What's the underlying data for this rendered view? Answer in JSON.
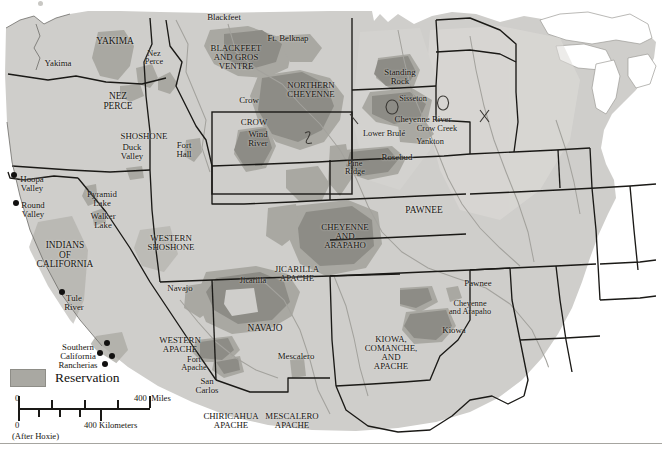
{
  "figure": {
    "credit": "(After Hoxie)"
  },
  "legend": {
    "swatch_label": "Reservation",
    "swatch_color": "#a9a8a2"
  },
  "scale": {
    "miles_zero": "0",
    "miles_max": "400  Miles",
    "km_zero": "0",
    "km_max": "400 Kilometers"
  },
  "colors": {
    "land": "#cfcecb",
    "land_light": "#d9d8d5",
    "reservation": "#a9a8a2",
    "reservation_dark": "#8d8c86",
    "water": "#ffffff",
    "border": "#1a1916",
    "river": "#a3a29d",
    "text": "#16140f"
  },
  "labels": [
    {
      "text": "Blackfeet",
      "x": 224,
      "y": 17,
      "size": "s85",
      "name": "label-blackfeet"
    },
    {
      "text": "Ft. Belknap",
      "x": 288,
      "y": 38,
      "size": "s85",
      "name": "label-ft-belknap"
    },
    {
      "text": "YAKIMA",
      "x": 115,
      "y": 42,
      "size": "s9",
      "name": "label-yakima-region"
    },
    {
      "text": "Yakima",
      "x": 58,
      "y": 63,
      "size": "s85",
      "name": "label-yakima"
    },
    {
      "text": "Nez\nPerce",
      "x": 154,
      "y": 58,
      "size": "s8",
      "name": "label-nez-perce-res"
    },
    {
      "text": "BLACKFEET\nAND GROS\nVENTRE",
      "x": 236,
      "y": 57,
      "size": "s85",
      "name": "label-blackfeet-gros-ventre"
    },
    {
      "text": "NORTHERN\nCHEYENNE",
      "x": 311,
      "y": 90,
      "size": "s85",
      "name": "label-northern-cheyenne"
    },
    {
      "text": "Standing\nRock",
      "x": 400,
      "y": 77,
      "size": "s85",
      "name": "label-standing-rock"
    },
    {
      "text": "NEZ\nPERCE",
      "x": 118,
      "y": 102,
      "size": "s9",
      "name": "label-nez-perce-region"
    },
    {
      "text": "Crow",
      "x": 249,
      "y": 100,
      "size": "s85",
      "name": "label-crow"
    },
    {
      "text": "Sisseton",
      "x": 413,
      "y": 99,
      "size": "s8",
      "name": "label-sisseton"
    },
    {
      "text": "CROW",
      "x": 254,
      "y": 122,
      "size": "s85",
      "name": "label-crow-region"
    },
    {
      "text": "Cheyenne River",
      "x": 423,
      "y": 119,
      "size": "s85",
      "name": "label-cheyenne-river"
    },
    {
      "text": "Crow Creek",
      "x": 437,
      "y": 129,
      "size": "s8",
      "name": "label-crow-creek"
    },
    {
      "text": "Wind\nRiver",
      "x": 258,
      "y": 139,
      "size": "s85",
      "name": "label-wind-river"
    },
    {
      "text": "Lower Brulé",
      "x": 384,
      "y": 134,
      "size": "s8",
      "name": "label-lower-brule"
    },
    {
      "text": "Yankton",
      "x": 430,
      "y": 142,
      "size": "s8",
      "name": "label-yankton"
    },
    {
      "text": "SHOSHONE",
      "x": 144,
      "y": 136,
      "size": "s85",
      "name": "label-shoshone"
    },
    {
      "text": "Duck\nValley",
      "x": 132,
      "y": 152,
      "size": "s85",
      "name": "label-duck-valley"
    },
    {
      "text": "Fort\nHall",
      "x": 184,
      "y": 150,
      "size": "s85",
      "name": "label-fort-hall"
    },
    {
      "text": "Rosebud",
      "x": 397,
      "y": 157,
      "size": "s85",
      "name": "label-rosebud"
    },
    {
      "text": "Pine\nRidge",
      "x": 355,
      "y": 168,
      "size": "s8",
      "name": "label-pine-ridge"
    },
    {
      "text": "Hoopa\nValley",
      "x": 32,
      "y": 184,
      "size": "s85",
      "name": "label-hoopa-valley"
    },
    {
      "text": "Round\nValley",
      "x": 33,
      "y": 210,
      "size": "s85",
      "name": "label-round-valley"
    },
    {
      "text": "Pyramid\nLake",
      "x": 102,
      "y": 199,
      "size": "s85",
      "name": "label-pyramid-lake"
    },
    {
      "text": "Walker\nLake",
      "x": 103,
      "y": 221,
      "size": "s85",
      "name": "label-walker-lake"
    },
    {
      "text": "PAWNEE",
      "x": 424,
      "y": 211,
      "size": "s9",
      "name": "label-pawnee-region"
    },
    {
      "text": "WESTERN\nSHOSHONE",
      "x": 171,
      "y": 243,
      "size": "s85",
      "name": "label-western-shoshone"
    },
    {
      "text": "CHEYENNE\nAND\nARAPAHO",
      "x": 345,
      "y": 236,
      "size": "s85",
      "name": "label-cheyenne-arapaho-region"
    },
    {
      "text": "INDIANS\nOF\nCALIFORNIA",
      "x": 65,
      "y": 255,
      "size": "s9",
      "name": "label-indians-of-california"
    },
    {
      "text": "JICARILLA\nAPACHE",
      "x": 297,
      "y": 274,
      "size": "s85",
      "name": "label-jicarilla-apache"
    },
    {
      "text": "Jicarilla",
      "x": 253,
      "y": 281,
      "size": "s8",
      "name": "label-jicarilla"
    },
    {
      "text": "Navajo",
      "x": 180,
      "y": 288,
      "size": "s85",
      "name": "label-navajo-res"
    },
    {
      "text": "Pawnee",
      "x": 478,
      "y": 283,
      "size": "s85",
      "name": "label-pawnee"
    },
    {
      "text": "Tule\nRiver",
      "x": 74,
      "y": 303,
      "size": "s85",
      "name": "label-tule-river"
    },
    {
      "text": "Cheyenne\nand Arapaho",
      "x": 470,
      "y": 308,
      "size": "s8",
      "name": "label-cheyenne-arapaho"
    },
    {
      "text": "NAVAJO",
      "x": 265,
      "y": 329,
      "size": "s9",
      "name": "label-navajo-region"
    },
    {
      "text": "Kiowa",
      "x": 454,
      "y": 330,
      "size": "s85",
      "name": "label-kiowa"
    },
    {
      "text": "KIOWA,\nCOMANCHE,\nAND\nAPACHE",
      "x": 391,
      "y": 353,
      "size": "s85",
      "name": "label-kiowa-comanche-apache"
    },
    {
      "text": "WESTERN\nAPACHE",
      "x": 180,
      "y": 345,
      "size": "s85",
      "name": "label-western-apache"
    },
    {
      "text": "Mescalero",
      "x": 296,
      "y": 356,
      "size": "s85",
      "name": "label-mescalero"
    },
    {
      "text": "Southern\nCalifornia\nRancherias",
      "x": 78,
      "y": 356,
      "size": "s85",
      "name": "label-southern-california-rancherias"
    },
    {
      "text": "Fort\nApache",
      "x": 194,
      "y": 364,
      "size": "s8",
      "name": "label-fort-apache"
    },
    {
      "text": "San\nCarlos",
      "x": 207,
      "y": 386,
      "size": "s85",
      "name": "label-san-carlos"
    },
    {
      "text": "CHIRICAHUA\nAPACHE",
      "x": 231,
      "y": 421,
      "size": "s85",
      "name": "label-chiricahua-apache"
    },
    {
      "text": "MESCALERO\nAPACHE",
      "x": 292,
      "y": 421,
      "size": "s85",
      "name": "label-mescalero-apache"
    }
  ],
  "markers": [
    {
      "x": 14,
      "y": 175,
      "name": "marker-hoopa-valley"
    },
    {
      "x": 16,
      "y": 203,
      "name": "marker-round-valley"
    },
    {
      "x": 62,
      "y": 292,
      "name": "marker-tule-river"
    },
    {
      "x": 107,
      "y": 343,
      "name": "marker-socal-1"
    },
    {
      "x": 100,
      "y": 353,
      "name": "marker-socal-2"
    },
    {
      "x": 112,
      "y": 356,
      "name": "marker-socal-3"
    },
    {
      "x": 105,
      "y": 364,
      "name": "marker-socal-4"
    }
  ]
}
